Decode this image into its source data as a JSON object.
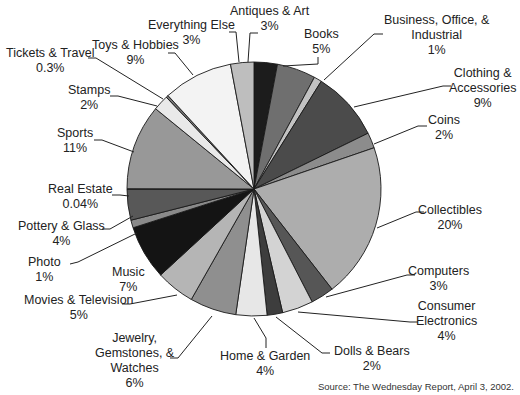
{
  "chart_data": {
    "type": "pie",
    "title": "",
    "source": "Source: The Wednesday Report, April 3, 2002.",
    "start_angle_deg": 0,
    "direction": "clockwise",
    "slices": [
      {
        "label": "Antiques & Art",
        "value": 3,
        "pct": "3%",
        "color": "#1c1c1c"
      },
      {
        "label": "Books",
        "value": 5,
        "pct": "5%",
        "color": "#6f6f6f"
      },
      {
        "label": "Business, Office, & Industrial",
        "value": 1,
        "pct": "1%",
        "color": "#c2c2c2"
      },
      {
        "label": "Clothing & Accessories",
        "value": 9,
        "pct": "9%",
        "color": "#4b4b4b"
      },
      {
        "label": "Coins",
        "value": 2,
        "pct": "2%",
        "color": "#8c8c8c"
      },
      {
        "label": "Collectibles",
        "value": 20,
        "pct": "20%",
        "color": "#adadad"
      },
      {
        "label": "Computers",
        "value": 3,
        "pct": "3%",
        "color": "#565656"
      },
      {
        "label": "Consumer Electronics",
        "value": 4,
        "pct": "4%",
        "color": "#d3d3d3"
      },
      {
        "label": "Dolls & Bears",
        "value": 2,
        "pct": "2%",
        "color": "#3d3d3d"
      },
      {
        "label": "Home & Garden",
        "value": 4,
        "pct": "4%",
        "color": "#e7e7e7"
      },
      {
        "label": "Jewelry, Gemstones, & Watches",
        "value": 6,
        "pct": "6%",
        "color": "#8f8f8f"
      },
      {
        "label": "Movies & Television",
        "value": 5,
        "pct": "5%",
        "color": "#b5b5b5"
      },
      {
        "label": "Music",
        "value": 7,
        "pct": "7%",
        "color": "#141414"
      },
      {
        "label": "Photo",
        "value": 1,
        "pct": "1%",
        "color": "#8a8a8a"
      },
      {
        "label": "Pottery & Glass",
        "value": 4,
        "pct": "4%",
        "color": "#585858"
      },
      {
        "label": "Real Estate",
        "value": 0.04,
        "pct": "0.04%",
        "color": "#444444"
      },
      {
        "label": "Sports",
        "value": 11,
        "pct": "11%",
        "color": "#989898"
      },
      {
        "label": "Stamps",
        "value": 2,
        "pct": "2%",
        "color": "#e9e9e9"
      },
      {
        "label": "Tickets & Travel",
        "value": 0.3,
        "pct": "0.3%",
        "color": "#777777"
      },
      {
        "label": "Toys & Hobbies",
        "value": 9,
        "pct": "9%",
        "color": "#f3f3f3"
      },
      {
        "label": "Everything Else",
        "value": 3,
        "pct": "3%",
        "color": "#bebebe"
      }
    ]
  },
  "labels": {
    "antiques": {
      "l1": "Antiques & Art",
      "l2": "3%"
    },
    "books": {
      "l1": "Books",
      "l2": "5%"
    },
    "business": {
      "l1": "Business, Office, &",
      "l2": "Industrial",
      "l3": "1%"
    },
    "clothing": {
      "l1": "Clothing &",
      "l2": "Accessories",
      "l3": "9%"
    },
    "coins": {
      "l1": "Coins",
      "l2": "2%"
    },
    "collectibles": {
      "l1": "Collectibles",
      "l2": "20%"
    },
    "computers": {
      "l1": "Computers",
      "l2": "3%"
    },
    "consumer": {
      "l1": "Consumer",
      "l2": "Electronics",
      "l3": "4%"
    },
    "dolls": {
      "l1": "Dolls & Bears",
      "l2": "2%"
    },
    "home": {
      "l1": "Home & Garden",
      "l2": "4%"
    },
    "jewelry": {
      "l1": "Jewelry,",
      "l2": "Gemstones, &",
      "l3": "Watches",
      "l4": "6%"
    },
    "movies": {
      "l1": "Movies & Television",
      "l2": "5%"
    },
    "music": {
      "l1": "Music",
      "l2": "7%"
    },
    "photo": {
      "l1": "Photo",
      "l2": "1%"
    },
    "pottery": {
      "l1": "Pottery & Glass",
      "l2": "4%"
    },
    "realestate": {
      "l1": "Real Estate",
      "l2": "0.04%"
    },
    "sports": {
      "l1": "Sports",
      "l2": "11%"
    },
    "stamps": {
      "l1": "Stamps",
      "l2": "2%"
    },
    "tickets": {
      "l1": "Tickets & Travel",
      "l2": "0.3%"
    },
    "toys": {
      "l1": "Toys & Hobbies",
      "l2": "9%"
    },
    "everything": {
      "l1": "Everything Else",
      "l2": "3%"
    }
  }
}
